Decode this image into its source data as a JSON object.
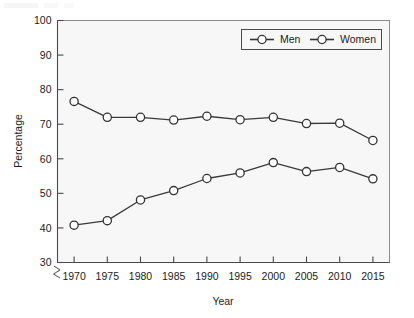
{
  "chart_data": {
    "type": "line",
    "title": "",
    "xlabel": "Year",
    "ylabel": "Percentage",
    "categories": [
      1970,
      1975,
      1980,
      1985,
      1990,
      1995,
      2000,
      2005,
      2010,
      2015
    ],
    "x_tick_labels": [
      "1970",
      "1975",
      "1980",
      "1985",
      "1990",
      "1995",
      "2000",
      "2005",
      "2010",
      "2015"
    ],
    "y_tick_labels": [
      "30",
      "40",
      "50",
      "60",
      "70",
      "80",
      "90",
      "100"
    ],
    "y_ticks": [
      30,
      40,
      50,
      60,
      70,
      80,
      90,
      100
    ],
    "xlim": [
      1967.5,
      2017.5
    ],
    "ylim": [
      30,
      100
    ],
    "y_axis_break": true,
    "grid": false,
    "legend_position": "top-right",
    "series": [
      {
        "name": "Men",
        "marker": "circle-open",
        "color": "#333333",
        "values": [
          76.6,
          72.0,
          72.0,
          71.2,
          72.3,
          71.3,
          72.0,
          70.2,
          70.3,
          65.3
        ]
      },
      {
        "name": "Women",
        "marker": "circle-open",
        "color": "#333333",
        "values": [
          40.8,
          42.1,
          48.1,
          50.8,
          54.3,
          55.9,
          58.9,
          56.3,
          57.5,
          54.2
        ]
      }
    ]
  },
  "legend": {
    "entries": [
      {
        "label": "Men"
      },
      {
        "label": "Women"
      }
    ]
  },
  "axes": {
    "x_title": "Year",
    "y_title": "Percentage"
  }
}
